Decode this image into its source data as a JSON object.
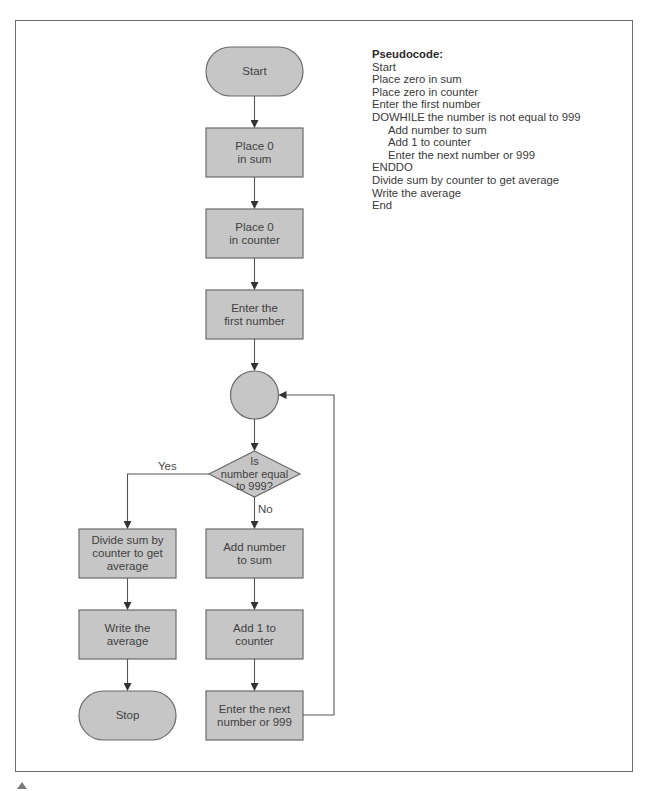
{
  "colors": {
    "shape_fill": "#c6c6c6",
    "shape_stroke": "#6b6b6b",
    "line": "#555555",
    "frame": "#6a6a6a"
  },
  "flowchart": {
    "start": "Start",
    "place_sum": "Place 0\nin sum",
    "place_counter": "Place 0\nin counter",
    "enter_first": "Enter the\nfirst number",
    "connector": "",
    "decision": "Is\nnumber equal\nto 999?",
    "yes_label": "Yes",
    "no_label": "No",
    "divide": "Divide sum by\ncounter to get\naverage",
    "write": "Write the\naverage",
    "stop": "Stop",
    "add_number": "Add number\nto sum",
    "add_one": "Add 1 to\ncounter",
    "enter_next": "Enter the next\nnumber or 999"
  },
  "pseudocode": {
    "title": "Pseudocode:",
    "lines": [
      {
        "text": "Start",
        "indent": false
      },
      {
        "text": "Place zero in sum",
        "indent": false
      },
      {
        "text": "Place zero in counter",
        "indent": false
      },
      {
        "text": "Enter the first number",
        "indent": false
      },
      {
        "text": "DOWHILE the number is not equal to 999",
        "indent": false
      },
      {
        "text": "Add number to sum",
        "indent": true
      },
      {
        "text": "Add 1 to counter",
        "indent": true
      },
      {
        "text": "Enter the next number or 999",
        "indent": true
      },
      {
        "text": "ENDDO",
        "indent": false
      },
      {
        "text": "Divide sum by counter to get average",
        "indent": false
      },
      {
        "text": "Write the average",
        "indent": false
      },
      {
        "text": "End",
        "indent": false
      }
    ]
  }
}
